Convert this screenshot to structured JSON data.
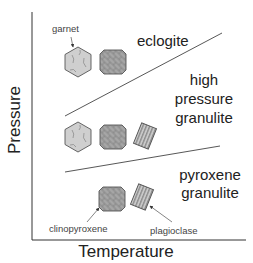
{
  "axes": {
    "x_label": "Temperature",
    "y_label": "Pressure"
  },
  "fields": {
    "eclogite": "eclogite",
    "hp_granulite_line1": "high",
    "hp_granulite_line2": "pressure",
    "hp_granulite_line3": "granulite",
    "px_granulite_line1": "pyroxene",
    "px_granulite_line2": "granulite"
  },
  "minerals": {
    "garnet": "garnet",
    "clinopyroxene": "clinopyroxene",
    "plagioclase": "plagioclase"
  },
  "assemblages": [
    {
      "field": "eclogite",
      "minerals": [
        "garnet",
        "clinopyroxene"
      ]
    },
    {
      "field": "high pressure granulite",
      "minerals": [
        "garnet",
        "clinopyroxene",
        "plagioclase"
      ]
    },
    {
      "field": "pyroxene granulite",
      "minerals": [
        "clinopyroxene",
        "plagioclase"
      ]
    }
  ],
  "colors": {
    "axis": "#333333",
    "boundary": "#444444",
    "garnet_fill": "#cfcfcf",
    "cpx_fill": "#a9a9a9",
    "plag_fill": "#bdbdbd",
    "outline": "#555555"
  }
}
